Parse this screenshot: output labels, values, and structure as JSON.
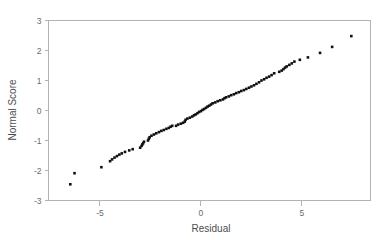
{
  "chart_data": {
    "type": "scatter",
    "title": "",
    "subtitle": "",
    "xlabel": "Residual",
    "ylabel": "Normal Score",
    "xlim": [
      -7.55,
      8.4
    ],
    "ylim": [
      -3,
      3
    ],
    "xticks": [
      -5,
      0,
      5
    ],
    "xtick_labels": [
      "-5",
      "0",
      "5"
    ],
    "yticks": [
      3,
      2,
      1,
      0,
      -1,
      -2,
      -3
    ],
    "ytick_labels": [
      "3",
      "2",
      "1",
      "0",
      "-1",
      "-2",
      "-3"
    ],
    "grid": false,
    "legend": null,
    "legend_position": "none",
    "marker": "square",
    "marker_size": 2.6,
    "marker_color": "#111111",
    "frame_color": "#b3b3b3",
    "background_color": "#ffffff",
    "series": [
      {
        "name": "Residual vs Normal Score",
        "points": [
          [
            -6.47,
            -2.46
          ],
          [
            -6.26,
            -2.09
          ],
          [
            -4.93,
            -1.89
          ],
          [
            -4.5,
            -1.69
          ],
          [
            -4.4,
            -1.63
          ],
          [
            -4.28,
            -1.57
          ],
          [
            -4.16,
            -1.52
          ],
          [
            -4.04,
            -1.47
          ],
          [
            -3.92,
            -1.43
          ],
          [
            -3.76,
            -1.38
          ],
          [
            -3.55,
            -1.33
          ],
          [
            -3.38,
            -1.29
          ],
          [
            -3.01,
            -1.24
          ],
          [
            -2.94,
            -1.18
          ],
          [
            -2.9,
            -1.13
          ],
          [
            -2.86,
            -1.09
          ],
          [
            -2.82,
            -1.04
          ],
          [
            -2.62,
            -1.0
          ],
          [
            -2.58,
            -0.94
          ],
          [
            -2.54,
            -0.89
          ],
          [
            -2.45,
            -0.84
          ],
          [
            -2.33,
            -0.8
          ],
          [
            -2.21,
            -0.76
          ],
          [
            -2.08,
            -0.72
          ],
          [
            -1.96,
            -0.68
          ],
          [
            -1.84,
            -0.65
          ],
          [
            -1.71,
            -0.61
          ],
          [
            -1.59,
            -0.58
          ],
          [
            -1.5,
            -0.54
          ],
          [
            -1.42,
            -0.51
          ],
          [
            -1.23,
            -0.51
          ],
          [
            -1.13,
            -0.47
          ],
          [
            -1.0,
            -0.44
          ],
          [
            -0.88,
            -0.41
          ],
          [
            -0.8,
            -0.37
          ],
          [
            -0.76,
            -0.31
          ],
          [
            -0.67,
            -0.27
          ],
          [
            -0.55,
            -0.24
          ],
          [
            -0.43,
            -0.2
          ],
          [
            -0.34,
            -0.16
          ],
          [
            -0.26,
            -0.13
          ],
          [
            -0.17,
            -0.09
          ],
          [
            -0.09,
            -0.05
          ],
          [
            0.0,
            -0.02
          ],
          [
            0.08,
            0.02
          ],
          [
            0.16,
            0.05
          ],
          [
            0.25,
            0.09
          ],
          [
            0.33,
            0.13
          ],
          [
            0.41,
            0.16
          ],
          [
            0.5,
            0.2
          ],
          [
            0.58,
            0.24
          ],
          [
            0.71,
            0.27
          ],
          [
            0.83,
            0.31
          ],
          [
            0.96,
            0.34
          ],
          [
            1.09,
            0.37
          ],
          [
            1.17,
            0.41
          ],
          [
            1.25,
            0.44
          ],
          [
            1.38,
            0.47
          ],
          [
            1.5,
            0.51
          ],
          [
            1.63,
            0.54
          ],
          [
            1.75,
            0.58
          ],
          [
            1.88,
            0.61
          ],
          [
            2.0,
            0.65
          ],
          [
            2.13,
            0.68
          ],
          [
            2.25,
            0.72
          ],
          [
            2.38,
            0.76
          ],
          [
            2.5,
            0.8
          ],
          [
            2.63,
            0.84
          ],
          [
            2.75,
            0.89
          ],
          [
            2.88,
            0.94
          ],
          [
            3.0,
            1.0
          ],
          [
            3.13,
            1.04
          ],
          [
            3.25,
            1.09
          ],
          [
            3.38,
            1.13
          ],
          [
            3.5,
            1.18
          ],
          [
            3.63,
            1.24
          ],
          [
            3.88,
            1.29
          ],
          [
            4.0,
            1.33
          ],
          [
            4.09,
            1.38
          ],
          [
            4.17,
            1.43
          ],
          [
            4.25,
            1.47
          ],
          [
            4.38,
            1.52
          ],
          [
            4.5,
            1.57
          ],
          [
            4.63,
            1.63
          ],
          [
            4.9,
            1.69
          ],
          [
            5.3,
            1.77
          ],
          [
            5.9,
            1.92
          ],
          [
            6.5,
            2.12
          ],
          [
            7.45,
            2.48
          ]
        ]
      }
    ]
  },
  "labels": {
    "x_axis_title": "Residual",
    "y_axis_title": "Normal Score"
  }
}
